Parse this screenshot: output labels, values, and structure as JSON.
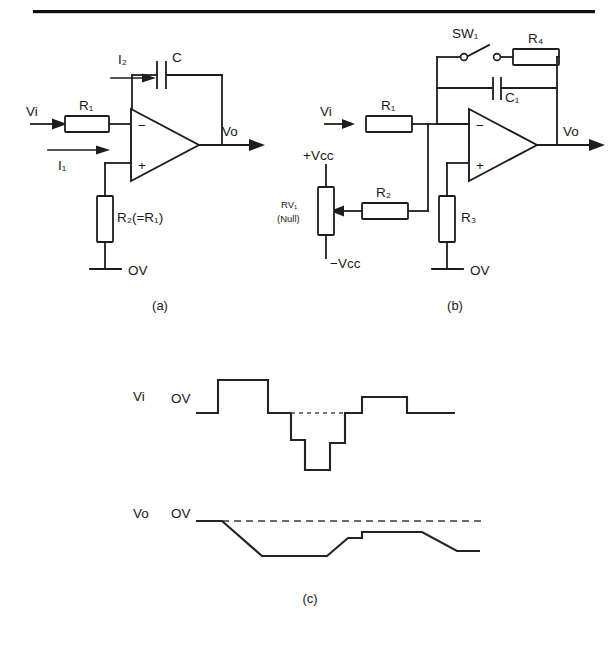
{
  "figure": {
    "kind": "circuit-schematic",
    "top_rule": true,
    "panels": [
      {
        "id": "a",
        "caption": "(a)",
        "title_note": "Basic integrator",
        "labels": {
          "vi": "Vi",
          "vo": "Vo",
          "i1": "I₁",
          "i2": "I₂",
          "r1": "R₁",
          "c": "C",
          "r2": "R₂(=R₁)",
          "gnd": "OV",
          "minus": "−",
          "plus": "+"
        }
      },
      {
        "id": "b",
        "caption": "(b)",
        "title_note": "Practical integrator with reset and null",
        "labels": {
          "vi": "Vi",
          "vo": "Vo",
          "sw1": "SW₁",
          "r4": "R₄",
          "c1": "C₁",
          "r1": "R₁",
          "r2": "R₂",
          "r3": "R₃",
          "rv1": "RV₁",
          "rv1_note": "(Null)",
          "vcc_pos": "+Vcc",
          "vcc_neg": "−Vcc",
          "gnd": "OV",
          "minus": "−",
          "plus": "+"
        }
      },
      {
        "id": "c",
        "caption": "(c)",
        "title_note": "Input and output waveforms",
        "labels": {
          "vi": "Vi",
          "vo": "Vo",
          "zero_in": "OV",
          "zero_out": "OV"
        }
      }
    ]
  },
  "chart_data": {
    "type": "line",
    "xlabel": "",
    "ylabel": "",
    "grid": false,
    "legend": "none",
    "series": [
      {
        "name": "Vi",
        "note": "Stepped input waveform referenced to OV",
        "baseline_label": "OV",
        "points_px": [
          [
            196,
            413
          ],
          [
            218,
            413
          ],
          [
            218,
            380
          ],
          [
            268,
            380
          ],
          [
            268,
            413
          ],
          [
            291,
            413
          ],
          [
            291,
            440
          ],
          [
            305,
            440
          ],
          [
            305,
            470
          ],
          [
            330,
            470
          ],
          [
            330,
            443
          ],
          [
            345,
            443
          ],
          [
            345,
            413
          ],
          [
            362,
            413
          ],
          [
            362,
            397
          ],
          [
            407,
            397
          ],
          [
            407,
            413
          ],
          [
            455,
            413
          ]
        ],
        "levels": [
          0,
          1,
          0,
          -1,
          -2,
          -1,
          0,
          0.5,
          0
        ]
      },
      {
        "name": "Vo",
        "note": "Integrated ramp output, always below OV",
        "baseline_label": "OV",
        "points_px": [
          [
            196,
            521
          ],
          [
            222,
            521
          ],
          [
            262,
            556
          ],
          [
            295,
            556
          ],
          [
            327,
            556
          ],
          [
            348,
            538
          ],
          [
            362,
            538
          ],
          [
            362,
            532
          ],
          [
            395,
            532
          ],
          [
            422,
            532
          ],
          [
            457,
            551
          ],
          [
            480,
            551
          ]
        ]
      }
    ],
    "annotations": [
      {
        "text": "OV",
        "axis": "Vi",
        "kind": "baseline-reference"
      },
      {
        "text": "OV",
        "axis": "Vo",
        "kind": "baseline-reference"
      }
    ]
  }
}
